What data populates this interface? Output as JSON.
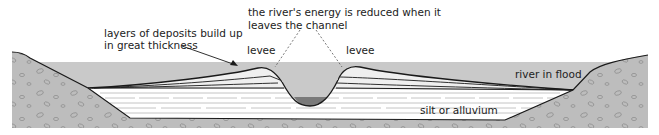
{
  "diagram": {
    "type": "cross-section",
    "labels": {
      "deposits": [
        "layers of deposits build up",
        "in great thickness"
      ],
      "energy": [
        "the river's energy is reduced when it",
        "leaves the channel"
      ],
      "levee_left": "levee",
      "levee_right": "levee",
      "flood": "river in flood",
      "silt": "silt or alluvium"
    },
    "colors": {
      "flood_water": "#c9c9c9",
      "bedrock": "#bdbdbd",
      "channel_water": "#7a7a7a",
      "silt": "#ffffff",
      "outline": "#1a1a1a"
    }
  }
}
